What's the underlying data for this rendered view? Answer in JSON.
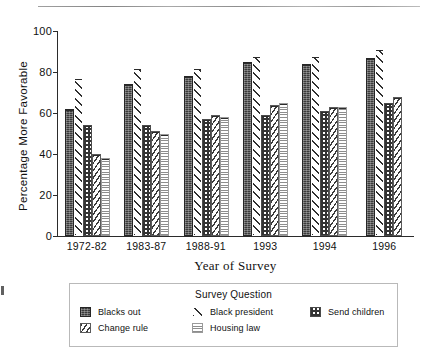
{
  "chart_data": {
    "type": "bar",
    "title": "",
    "xlabel": "Year of Survey",
    "ylabel": "Percentage More Favorable",
    "ylim": [
      0,
      100
    ],
    "yticks": [
      0,
      20,
      40,
      60,
      80,
      100
    ],
    "grid": false,
    "legend_position": "bottom",
    "legend_title": "Survey Question",
    "categories": [
      "1972-82",
      "1983-87",
      "1988-91",
      "1993",
      "1994",
      "1996"
    ],
    "series": [
      {
        "name": "Blacks out",
        "values": [
          62,
          74,
          78,
          85,
          84,
          87
        ]
      },
      {
        "name": "Black president",
        "values": [
          77,
          82,
          82,
          88,
          88,
          91
        ]
      },
      {
        "name": "Send children",
        "values": [
          54,
          54,
          57,
          59,
          61,
          65
        ]
      },
      {
        "name": "Change rule",
        "values": [
          40,
          51,
          59,
          64,
          63,
          68
        ]
      },
      {
        "name": "Housing law",
        "values": [
          38,
          50,
          58,
          65,
          63,
          null
        ]
      }
    ]
  },
  "axis": {
    "y_ticks": [
      "100",
      "80",
      "60",
      "40",
      "20",
      "0"
    ],
    "y_title": "Percentage More Favorable",
    "x_title": "Year of Survey",
    "x_ticks": [
      "1972-82",
      "1983-87",
      "1988-91",
      "1993",
      "1994",
      "1996"
    ]
  },
  "legend": {
    "title": "Survey Question",
    "entries": [
      {
        "label": "Blacks out",
        "pattern": "dark-solid-textured"
      },
      {
        "label": "Change rule",
        "pattern": "diagonal-hatch-dense"
      },
      {
        "label": "Black president",
        "pattern": "diagonal-hatch-wide"
      },
      {
        "label": "Housing law",
        "pattern": "horizontal-lines-light"
      },
      {
        "label": "Send children",
        "pattern": "checkerboard"
      }
    ]
  }
}
